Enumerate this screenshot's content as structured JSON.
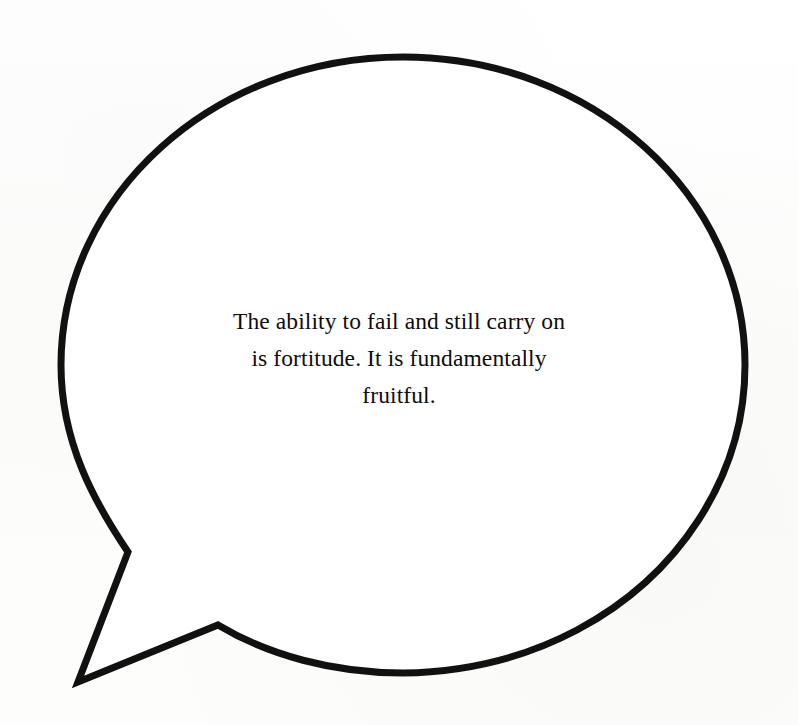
{
  "canvas": {
    "width": 798,
    "height": 725,
    "background_color": "#fdfdfd"
  },
  "bubble": {
    "name": "speech-bubble",
    "shape": "ellipse-with-pointed-tail",
    "outline_color": "#111111",
    "fill_color": "#ffffff",
    "stroke_width_px": 7,
    "ellipse": {
      "center_x": 403,
      "center_y": 365,
      "radius_x": 342,
      "radius_y": 308
    },
    "tail": {
      "position": "bottom-left",
      "upper_junction_x": 128,
      "upper_junction_y": 552,
      "tip_x": 78,
      "tip_y": 682,
      "lower_junction_x": 218,
      "lower_junction_y": 625
    }
  },
  "quote": {
    "name": "quote-text",
    "full_text": "The ability to fail and still carry on is fortitude. It is fundamentally fruitful.",
    "alignment": "center",
    "text_color": "#0d0d0d",
    "lines": [
      "The ability to fail and still carry on",
      "is fortitude. It is fundamentally",
      "fruitful."
    ]
  }
}
